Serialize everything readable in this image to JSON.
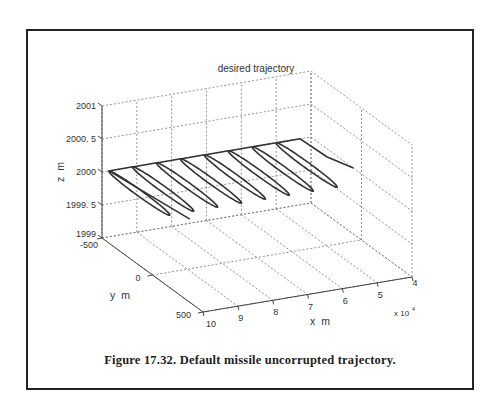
{
  "chart_data": {
    "type": "line",
    "subtype": "3d-line",
    "title": "desired trajectory",
    "xlabel": "x  m",
    "ylabel": "y  m",
    "zlabel": "z  m",
    "x_exponent_label": "x 10",
    "x_exponent": "4",
    "x_ticks": [
      "10",
      "9",
      "8",
      "7",
      "6",
      "5",
      "4"
    ],
    "y_ticks": [
      "-500",
      "0",
      "500"
    ],
    "z_ticks": [
      "2001",
      "2000.5",
      "2000",
      "1999.5",
      "1999"
    ],
    "xlim": [
      40000,
      100000
    ],
    "ylim": [
      -500,
      500
    ],
    "zlim": [
      1999,
      2001
    ],
    "grid": true,
    "series": [
      {
        "name": "desired trajectory",
        "description": "periodic weave at constant altitude z=2000 m; 8 elongated loops along x from ~9.8e4 m to ~4e4 m, lateral y swinging roughly between -500 and +100 m",
        "loops": 8,
        "z": 2000,
        "x_start": 98000,
        "x_end": 40000
      }
    ]
  },
  "caption": "Figure 17.32. Default missile uncorrupted trajectory."
}
